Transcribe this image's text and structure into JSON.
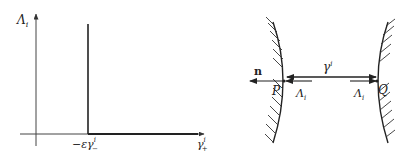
{
  "left_plot": {
    "y_axis_label": "Λ",
    "y_axis_label_sub": "i",
    "x_tick_label_prefix": "−εγ",
    "x_tick_label_sup": "i",
    "x_tick_label_sub": "−",
    "x_axis_label": "γ",
    "x_axis_label_sup": "i",
    "x_axis_label_sub": "+"
  },
  "right_diagram": {
    "normal_label": "n",
    "gap_label": "γ",
    "gap_label_sup": "i",
    "point_left": "P",
    "point_right": "Q",
    "force_left_label": "Λ",
    "force_left_sub": "i",
    "force_right_label": "Λ",
    "force_right_sub": "i"
  },
  "colors": {
    "line": "#222222",
    "axis": "#444444",
    "background": "#ffffff"
  }
}
